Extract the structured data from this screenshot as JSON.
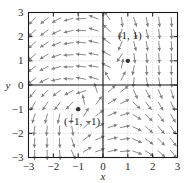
{
  "chart_data": {
    "type": "scatter",
    "title": "",
    "subtitle": "",
    "xlabel": "x",
    "ylabel": "y",
    "xlim": [
      -3,
      3
    ],
    "ylim": [
      -3,
      3
    ],
    "grid": true,
    "legend": null,
    "xticks": [
      -3,
      -2,
      -1,
      0,
      1,
      2,
      3
    ],
    "xtick_labels": [
      "−3",
      "−2",
      "−1",
      "0",
      "1",
      "2",
      "3"
    ],
    "yticks": [
      -3,
      -2,
      -1,
      0,
      1,
      2,
      3
    ],
    "ytick_labels": [
      "−3",
      "−2",
      "−1",
      "0",
      "1",
      "2",
      "3"
    ],
    "annotations": [
      {
        "text": "(1, 1)",
        "x": 1,
        "y": 1,
        "dx": 2,
        "dy": -22
      },
      {
        "text": "(−1, −1)",
        "x": -1,
        "y": -1,
        "dx": 4,
        "dy": 16
      }
    ],
    "points": [
      {
        "x": 1,
        "y": 1,
        "label": "(1, 1)"
      },
      {
        "x": -1,
        "y": -1,
        "label": "(−1, −1)"
      }
    ],
    "vector_field": {
      "system": "dx/dt = y - x, dy/dt = 1 - x*y",
      "arrow_color": "#7d7d7d",
      "step": 0.5,
      "arrows": [
        {
          "x": -2.75,
          "y": 2.75,
          "u": -0.7,
          "v": -0.71
        },
        {
          "x": -2.25,
          "y": 2.75,
          "u": -0.78,
          "v": -0.62
        },
        {
          "x": -1.75,
          "y": 2.75,
          "u": -0.88,
          "v": -0.47
        },
        {
          "x": -1.25,
          "y": 2.75,
          "u": -0.96,
          "v": -0.28
        },
        {
          "x": -0.75,
          "y": 2.75,
          "u": -1.0,
          "v": -0.05
        },
        {
          "x": -0.25,
          "y": 2.75,
          "u": -0.92,
          "v": 0.38
        },
        {
          "x": 0.25,
          "y": 2.75,
          "u": -0.6,
          "v": 0.8
        },
        {
          "x": 0.75,
          "y": 2.75,
          "u": 0.1,
          "v": -0.99
        },
        {
          "x": 1.25,
          "y": 2.75,
          "u": 0.3,
          "v": -0.95
        },
        {
          "x": 1.75,
          "y": 2.75,
          "u": 0.18,
          "v": -0.98
        },
        {
          "x": 2.25,
          "y": 2.75,
          "u": 0.1,
          "v": -0.99
        },
        {
          "x": 2.75,
          "y": 2.75,
          "u": 0.05,
          "v": -1.0
        },
        {
          "x": -2.75,
          "y": 2.25,
          "u": -0.72,
          "v": -0.69
        },
        {
          "x": -2.25,
          "y": 2.25,
          "u": -0.8,
          "v": -0.6
        },
        {
          "x": -1.75,
          "y": 2.25,
          "u": -0.9,
          "v": -0.44
        },
        {
          "x": -1.25,
          "y": 2.25,
          "u": -0.97,
          "v": -0.24
        },
        {
          "x": -0.75,
          "y": 2.25,
          "u": -1.0,
          "v": 0.02
        },
        {
          "x": -0.25,
          "y": 2.25,
          "u": -0.95,
          "v": 0.32
        },
        {
          "x": 0.25,
          "y": 2.25,
          "u": -0.7,
          "v": 0.72
        },
        {
          "x": 0.75,
          "y": 2.25,
          "u": -0.25,
          "v": -0.97
        },
        {
          "x": 1.25,
          "y": 2.25,
          "u": 0.35,
          "v": -0.94
        },
        {
          "x": 1.75,
          "y": 2.25,
          "u": 0.2,
          "v": -0.98
        },
        {
          "x": 2.25,
          "y": 2.25,
          "u": 0.1,
          "v": -0.99
        },
        {
          "x": 2.75,
          "y": 2.25,
          "u": 0.05,
          "v": -1.0
        },
        {
          "x": -2.75,
          "y": 1.75,
          "u": -0.74,
          "v": -0.67
        },
        {
          "x": -2.25,
          "y": 1.75,
          "u": -0.83,
          "v": -0.56
        },
        {
          "x": -1.75,
          "y": 1.75,
          "u": -0.93,
          "v": -0.37
        },
        {
          "x": -1.25,
          "y": 1.75,
          "u": -0.99,
          "v": -0.15
        },
        {
          "x": -0.75,
          "y": 1.75,
          "u": -1.0,
          "v": 0.08
        },
        {
          "x": -0.25,
          "y": 1.75,
          "u": -0.97,
          "v": 0.24
        },
        {
          "x": 0.25,
          "y": 1.75,
          "u": -0.8,
          "v": 0.6
        },
        {
          "x": 0.75,
          "y": 1.75,
          "u": -0.4,
          "v": -0.92
        },
        {
          "x": 1.25,
          "y": 1.75,
          "u": 0.25,
          "v": -0.97
        },
        {
          "x": 1.75,
          "y": 1.75,
          "u": 0.15,
          "v": -0.99
        },
        {
          "x": 2.25,
          "y": 1.75,
          "u": 0.08,
          "v": -1.0
        },
        {
          "x": 2.75,
          "y": 1.75,
          "u": 0.04,
          "v": -1.0
        },
        {
          "x": -2.75,
          "y": 1.25,
          "u": -0.76,
          "v": -0.65
        },
        {
          "x": -2.25,
          "y": 1.25,
          "u": -0.86,
          "v": -0.51
        },
        {
          "x": -1.75,
          "y": 1.25,
          "u": -0.95,
          "v": -0.31
        },
        {
          "x": -1.25,
          "y": 1.25,
          "u": -1.0,
          "v": -0.05
        },
        {
          "x": -0.75,
          "y": 1.25,
          "u": -1.0,
          "v": 0.1
        },
        {
          "x": -0.25,
          "y": 1.25,
          "u": -0.98,
          "v": 0.2
        },
        {
          "x": 0.25,
          "y": 1.25,
          "u": -0.88,
          "v": 0.47
        },
        {
          "x": 0.75,
          "y": 1.25,
          "u": -0.55,
          "v": -0.84
        },
        {
          "x": 1.25,
          "y": 1.25,
          "u": 0.12,
          "v": -0.99
        },
        {
          "x": 1.75,
          "y": 1.25,
          "u": 0.1,
          "v": -0.99
        },
        {
          "x": 2.25,
          "y": 1.25,
          "u": 0.06,
          "v": -1.0
        },
        {
          "x": 2.75,
          "y": 1.25,
          "u": 0.03,
          "v": -1.0
        },
        {
          "x": -2.75,
          "y": 0.75,
          "u": -0.78,
          "v": -0.62
        },
        {
          "x": -2.25,
          "y": 0.75,
          "u": -0.88,
          "v": -0.47
        },
        {
          "x": -1.75,
          "y": 0.75,
          "u": -0.96,
          "v": -0.27
        },
        {
          "x": -1.25,
          "y": 0.75,
          "u": -1.0,
          "v": 0.0
        },
        {
          "x": -0.75,
          "y": 0.75,
          "u": -0.99,
          "v": 0.12
        },
        {
          "x": -0.25,
          "y": 0.75,
          "u": -0.99,
          "v": 0.16
        },
        {
          "x": 0.25,
          "y": 0.75,
          "u": -0.9,
          "v": 0.43
        },
        {
          "x": 0.75,
          "y": 0.75,
          "u": 0.2,
          "v": 0.98
        },
        {
          "x": 1.25,
          "y": 0.75,
          "u": -0.2,
          "v": -0.98
        },
        {
          "x": 1.75,
          "y": 0.75,
          "u": 0.05,
          "v": -1.0
        },
        {
          "x": 2.25,
          "y": 0.75,
          "u": 0.04,
          "v": -1.0
        },
        {
          "x": 2.75,
          "y": 0.75,
          "u": 0.02,
          "v": -1.0
        },
        {
          "x": -2.75,
          "y": 0.25,
          "u": -0.8,
          "v": -0.6
        },
        {
          "x": -2.25,
          "y": 0.25,
          "u": -0.9,
          "v": -0.44
        },
        {
          "x": -1.75,
          "y": 0.25,
          "u": -0.97,
          "v": -0.22
        },
        {
          "x": -1.25,
          "y": 0.25,
          "u": -1.0,
          "v": 0.04
        },
        {
          "x": -0.75,
          "y": 0.25,
          "u": -0.98,
          "v": 0.18
        },
        {
          "x": -0.25,
          "y": 0.25,
          "u": -0.96,
          "v": 0.28
        },
        {
          "x": 0.25,
          "y": 0.25,
          "u": -0.5,
          "v": 0.87
        },
        {
          "x": 0.75,
          "y": 0.25,
          "u": 0.45,
          "v": 0.89
        },
        {
          "x": 1.25,
          "y": 0.25,
          "u": -0.1,
          "v": -0.99
        },
        {
          "x": 1.75,
          "y": 0.25,
          "u": 0.2,
          "v": -0.98
        },
        {
          "x": 2.25,
          "y": 0.25,
          "u": 0.15,
          "v": -0.99
        },
        {
          "x": 2.75,
          "y": 0.25,
          "u": 0.08,
          "v": -1.0
        },
        {
          "x": -2.75,
          "y": -0.25,
          "u": -0.62,
          "v": -0.78
        },
        {
          "x": -2.25,
          "y": -0.25,
          "u": -0.7,
          "v": -0.71
        },
        {
          "x": -1.75,
          "y": -0.25,
          "u": -0.8,
          "v": -0.6
        },
        {
          "x": -1.25,
          "y": -0.25,
          "u": -0.88,
          "v": -0.47
        },
        {
          "x": -0.75,
          "y": -0.25,
          "u": -0.95,
          "v": -0.31
        },
        {
          "x": -0.25,
          "y": -0.25,
          "u": -0.3,
          "v": 0.95
        },
        {
          "x": 0.25,
          "y": -0.25,
          "u": 0.75,
          "v": 0.66
        },
        {
          "x": 0.75,
          "y": -0.25,
          "u": 0.8,
          "v": 0.6
        },
        {
          "x": 1.25,
          "y": -0.25,
          "u": 0.4,
          "v": -0.92
        },
        {
          "x": 1.75,
          "y": -0.25,
          "u": 0.45,
          "v": -0.89
        },
        {
          "x": 2.25,
          "y": -0.25,
          "u": 0.4,
          "v": -0.92
        },
        {
          "x": 2.75,
          "y": -0.25,
          "u": 0.3,
          "v": -0.95
        },
        {
          "x": -2.75,
          "y": -0.75,
          "u": -0.5,
          "v": -0.87
        },
        {
          "x": -2.25,
          "y": -0.75,
          "u": -0.55,
          "v": -0.84
        },
        {
          "x": -1.75,
          "y": -0.75,
          "u": -0.6,
          "v": -0.8
        },
        {
          "x": -1.25,
          "y": -0.75,
          "u": -0.7,
          "v": -0.71
        },
        {
          "x": -0.75,
          "y": -0.75,
          "u": -0.2,
          "v": 0.98
        },
        {
          "x": -0.25,
          "y": -0.75,
          "u": 0.6,
          "v": 0.8
        },
        {
          "x": 0.25,
          "y": -0.75,
          "u": 0.85,
          "v": 0.53
        },
        {
          "x": 0.75,
          "y": -0.75,
          "u": 0.9,
          "v": 0.44
        },
        {
          "x": 1.25,
          "y": -0.75,
          "u": 0.75,
          "v": -0.66
        },
        {
          "x": 1.75,
          "y": -0.75,
          "u": 0.6,
          "v": -0.8
        },
        {
          "x": 2.25,
          "y": -0.75,
          "u": 0.5,
          "v": -0.87
        },
        {
          "x": 2.75,
          "y": -0.75,
          "u": 0.4,
          "v": -0.92
        },
        {
          "x": -2.75,
          "y": -1.25,
          "u": -0.3,
          "v": -0.95
        },
        {
          "x": -2.25,
          "y": -1.25,
          "u": -0.25,
          "v": -0.97
        },
        {
          "x": -1.75,
          "y": -1.25,
          "u": -0.2,
          "v": -0.98
        },
        {
          "x": -1.25,
          "y": -1.25,
          "u": -0.1,
          "v": -0.99
        },
        {
          "x": -0.75,
          "y": -1.25,
          "u": 0.5,
          "v": 0.87
        },
        {
          "x": -0.25,
          "y": -1.25,
          "u": 0.8,
          "v": 0.6
        },
        {
          "x": 0.25,
          "y": -1.25,
          "u": 0.92,
          "v": 0.39
        },
        {
          "x": 0.75,
          "y": -1.25,
          "u": 0.96,
          "v": 0.28
        },
        {
          "x": 1.25,
          "y": -1.25,
          "u": 0.85,
          "v": -0.53
        },
        {
          "x": 1.75,
          "y": -1.25,
          "u": 0.7,
          "v": -0.71
        },
        {
          "x": 2.25,
          "y": -1.25,
          "u": 0.6,
          "v": -0.8
        },
        {
          "x": 2.75,
          "y": -1.25,
          "u": 0.5,
          "v": -0.87
        },
        {
          "x": -2.75,
          "y": -1.75,
          "u": -0.12,
          "v": -0.99
        },
        {
          "x": -2.25,
          "y": -1.75,
          "u": -0.08,
          "v": -1.0
        },
        {
          "x": -1.75,
          "y": -1.75,
          "u": -0.05,
          "v": -1.0
        },
        {
          "x": -1.25,
          "y": -1.75,
          "u": 0.15,
          "v": -0.99
        },
        {
          "x": -0.75,
          "y": -1.75,
          "u": 0.7,
          "v": 0.71
        },
        {
          "x": -0.25,
          "y": -1.75,
          "u": 0.88,
          "v": 0.47
        },
        {
          "x": 0.25,
          "y": -1.75,
          "u": 0.95,
          "v": 0.31
        },
        {
          "x": 0.75,
          "y": -1.75,
          "u": 0.98,
          "v": 0.18
        },
        {
          "x": 1.25,
          "y": -1.75,
          "u": 0.9,
          "v": -0.44
        },
        {
          "x": 1.75,
          "y": -1.75,
          "u": 0.75,
          "v": -0.66
        },
        {
          "x": 2.25,
          "y": -1.75,
          "u": 0.65,
          "v": -0.76
        },
        {
          "x": 2.75,
          "y": -1.75,
          "u": 0.55,
          "v": -0.84
        },
        {
          "x": -2.75,
          "y": -2.25,
          "u": -0.05,
          "v": -1.0
        },
        {
          "x": -2.25,
          "y": -2.25,
          "u": -0.02,
          "v": -1.0
        },
        {
          "x": -1.75,
          "y": -2.25,
          "u": 0.05,
          "v": -1.0
        },
        {
          "x": -1.25,
          "y": -2.25,
          "u": 0.3,
          "v": -0.95
        },
        {
          "x": -0.75,
          "y": -2.25,
          "u": 0.8,
          "v": 0.6
        },
        {
          "x": -0.25,
          "y": -2.25,
          "u": 0.92,
          "v": 0.39
        },
        {
          "x": 0.25,
          "y": -2.25,
          "u": 0.97,
          "v": 0.24
        },
        {
          "x": 0.75,
          "y": -2.25,
          "u": 0.99,
          "v": 0.12
        },
        {
          "x": 1.25,
          "y": -2.25,
          "u": 0.92,
          "v": -0.39
        },
        {
          "x": 1.75,
          "y": -2.25,
          "u": 0.8,
          "v": -0.6
        },
        {
          "x": 2.25,
          "y": -2.25,
          "u": 0.7,
          "v": -0.71
        },
        {
          "x": 2.75,
          "y": -2.25,
          "u": 0.6,
          "v": -0.8
        },
        {
          "x": -2.75,
          "y": -2.75,
          "u": -0.02,
          "v": -1.0
        },
        {
          "x": -2.25,
          "y": -2.75,
          "u": 0.02,
          "v": -1.0
        },
        {
          "x": -1.75,
          "y": -2.75,
          "u": 0.1,
          "v": -0.99
        },
        {
          "x": -1.25,
          "y": -2.75,
          "u": 0.4,
          "v": -0.92
        },
        {
          "x": -0.75,
          "y": -2.75,
          "u": 0.85,
          "v": 0.53
        },
        {
          "x": -0.25,
          "y": -2.75,
          "u": 0.94,
          "v": 0.34
        },
        {
          "x": 0.25,
          "y": -2.75,
          "u": 0.98,
          "v": 0.2
        },
        {
          "x": 0.75,
          "y": -2.75,
          "u": 1.0,
          "v": 0.08
        },
        {
          "x": 1.25,
          "y": -2.75,
          "u": 0.94,
          "v": -0.34
        },
        {
          "x": 1.75,
          "y": -2.75,
          "u": 0.84,
          "v": -0.55
        },
        {
          "x": 2.25,
          "y": -2.75,
          "u": 0.74,
          "v": -0.67
        },
        {
          "x": 2.75,
          "y": -2.75,
          "u": 0.64,
          "v": -0.77
        }
      ]
    }
  },
  "style": {
    "axis_color": "#1a1a1a",
    "grid_color": "#b4b4b4",
    "arrow_color": "#7d7d7d",
    "point_color": "#333333",
    "background": "#ffffff"
  }
}
